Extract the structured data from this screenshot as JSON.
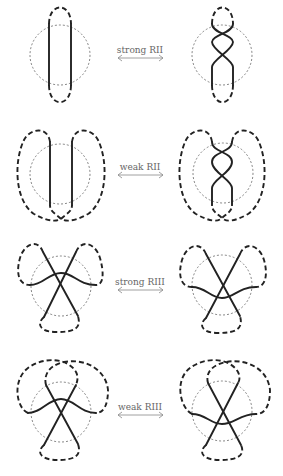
{
  "figure": {
    "panels": [
      {
        "id": "strong-rii",
        "label": "strong RII",
        "label_pos": [
          140,
          46
        ],
        "arrow_y": 58
      },
      {
        "id": "weak-rii",
        "label": "weak RII",
        "label_pos": [
          140,
          162
        ],
        "arrow_y": 175
      },
      {
        "id": "strong-riii",
        "label": "strong RIII",
        "label_pos": [
          140,
          277
        ],
        "arrow_y": 290
      },
      {
        "id": "weak-riii",
        "label": "weak RIII",
        "label_pos": [
          140,
          402
        ],
        "arrow_y": 415
      }
    ],
    "arrow_x": [
      118,
      163
    ],
    "colors": {
      "strand": "#222222",
      "circle": "#666666",
      "label": "#666666",
      "arrow": "#888888"
    }
  }
}
